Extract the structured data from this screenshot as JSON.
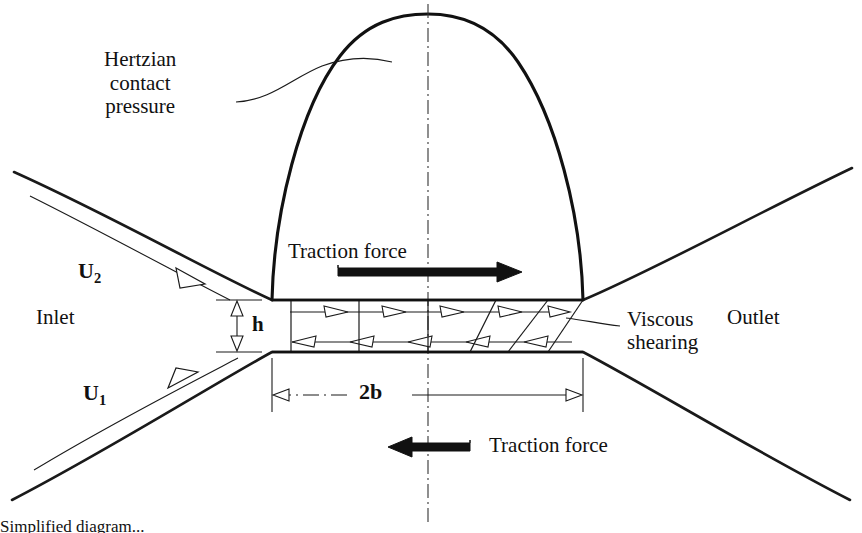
{
  "figure": {
    "labels": {
      "hertzian_line1": "Hertzian",
      "hertzian_line2": "contact",
      "hertzian_line3": "pressure",
      "traction_top": "Traction force",
      "traction_bottom": "Traction force",
      "inlet": "Inlet",
      "outlet": "Outlet",
      "viscous_line1": "Viscous",
      "viscous_line2": "shearing",
      "velocity_upper": "U",
      "velocity_upper_sub": "2",
      "velocity_lower": "U",
      "velocity_lower_sub": "1",
      "film_thickness": "h",
      "contact_width": "2b"
    },
    "caption": "Simplified diagram...",
    "colors": {
      "ink": "#111111",
      "line": "#1a1a1a",
      "background": "#ffffff"
    }
  }
}
